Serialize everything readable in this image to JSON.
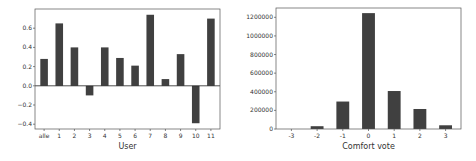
{
  "chart_data": [
    {
      "type": "bar",
      "title": "",
      "xlabel": "User",
      "ylabel": "",
      "categories": [
        "alle",
        "1",
        "2",
        "3",
        "4",
        "5",
        "6",
        "7",
        "8",
        "9",
        "10",
        "11"
      ],
      "values": [
        0.28,
        0.65,
        0.4,
        -0.1,
        0.4,
        0.29,
        0.21,
        0.74,
        0.07,
        0.33,
        -0.39,
        0.7
      ],
      "ylim": [
        -0.45,
        0.8
      ],
      "yticks": [
        -0.4,
        -0.2,
        0.0,
        0.2,
        0.4,
        0.6
      ],
      "ytick_labels": [
        "−0.4",
        "−0.2",
        "0.0",
        "0.2",
        "0.4",
        "0.6"
      ],
      "zero_line": true,
      "grid": false,
      "bar_color": "#404040"
    },
    {
      "type": "bar",
      "title": "",
      "xlabel": "Comfort vote",
      "ylabel": "",
      "categories": [
        "-3",
        "-2",
        "-1",
        "0",
        "1",
        "2",
        "3"
      ],
      "values": [
        0,
        30000,
        295000,
        1245000,
        408000,
        215000,
        40000
      ],
      "ylim": [
        0,
        1300000
      ],
      "yticks": [
        0,
        200000,
        400000,
        600000,
        800000,
        1000000,
        1200000
      ],
      "ytick_labels": [
        "0",
        "200000",
        "400000",
        "600000",
        "800000",
        "1000000",
        "1200000"
      ],
      "grid": false,
      "bar_color": "#404040"
    }
  ]
}
